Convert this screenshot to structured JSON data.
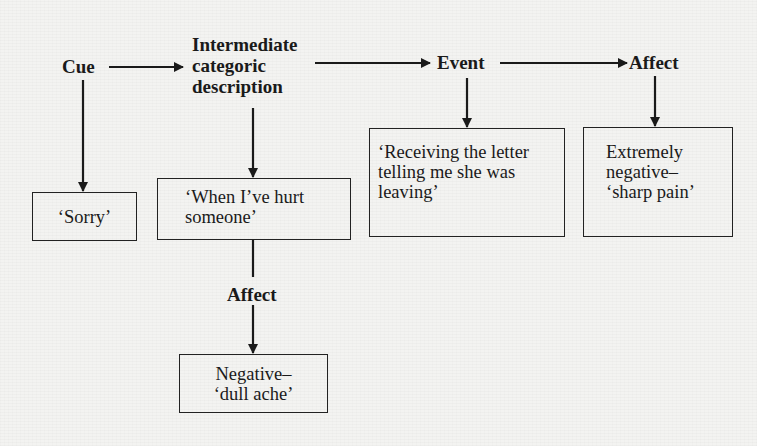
{
  "diagram": {
    "type": "flow",
    "nodes": {
      "cue": {
        "label": "Cue"
      },
      "intermediate": {
        "label": "Intermediate\ncategoric\ndescription"
      },
      "event": {
        "label": "Event"
      },
      "affect_top": {
        "label": "Affect"
      },
      "affect_mid": {
        "label": "Affect"
      }
    },
    "boxes": {
      "sorry": {
        "text": "‘Sorry’"
      },
      "hurt": {
        "text": "‘When I’ve hurt\nsomeone’"
      },
      "letter": {
        "text": "‘Receiving the letter\ntelling me she was\nleaving’"
      },
      "sharp_pain": {
        "text": "Extremely\nnegative–\n‘sharp pain’"
      },
      "dull_ache": {
        "text": "Negative–\n‘dull ache’"
      }
    },
    "edges": [
      {
        "from": "Cue",
        "to": "Intermediate categoric description"
      },
      {
        "from": "Intermediate categoric description",
        "to": "Event"
      },
      {
        "from": "Event",
        "to": "Affect"
      },
      {
        "from": "Cue",
        "to": "‘Sorry’"
      },
      {
        "from": "Intermediate categoric description",
        "to": "‘When I’ve hurt someone’"
      },
      {
        "from": "Event",
        "to": "‘Receiving the letter telling me she was leaving’"
      },
      {
        "from": "Affect",
        "to": "Extremely negative– ‘sharp pain’"
      },
      {
        "from": "‘When I’ve hurt someone’",
        "to": "Affect"
      },
      {
        "from": "Affect",
        "to": "Negative– ‘dull ache’"
      }
    ],
    "colors": {
      "ink": "#1a1a1a",
      "paper": "#f3f3f1"
    }
  }
}
